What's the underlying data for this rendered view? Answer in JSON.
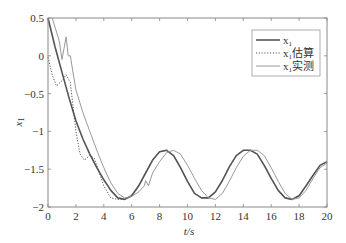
{
  "chart_data": {
    "type": "line",
    "title": "",
    "xlabel": "t/s",
    "ylabel": "x1",
    "xlim": [
      0,
      20
    ],
    "ylim": [
      -2,
      0.5
    ],
    "xticks": [
      0,
      2,
      4,
      6,
      8,
      10,
      12,
      14,
      16,
      18,
      20
    ],
    "yticks": [
      0.5,
      0,
      -0.5,
      -1,
      -1.5,
      -2
    ],
    "xtick_labels": [
      "0",
      "2",
      "4",
      "6",
      "8",
      "10",
      "12",
      "14",
      "16",
      "18",
      "20"
    ],
    "ytick_labels": [
      "0.5",
      "0",
      "−0.5",
      "−1",
      "−1.5",
      "−2"
    ],
    "grid": false,
    "legend_position": "upper right",
    "series": [
      {
        "name": "x1",
        "legend": "x₁",
        "style": "solid",
        "color": "#555555",
        "width": 1.6,
        "x": [
          0,
          0.5,
          1,
          1.5,
          2,
          2.5,
          3,
          3.5,
          4,
          4.5,
          5,
          5.5,
          6,
          6.5,
          7,
          7.5,
          8,
          8.5,
          9,
          9.5,
          10,
          10.5,
          11,
          11.5,
          12,
          12.5,
          13,
          13.5,
          14,
          14.5,
          15,
          15.5,
          16,
          16.5,
          17,
          17.5,
          18,
          18.5,
          19,
          19.5,
          20
        ],
        "y": [
          0.5,
          0.12,
          -0.22,
          -0.55,
          -0.86,
          -1.1,
          -1.3,
          -1.48,
          -1.64,
          -1.78,
          -1.88,
          -1.9,
          -1.85,
          -1.72,
          -1.55,
          -1.38,
          -1.27,
          -1.25,
          -1.32,
          -1.48,
          -1.66,
          -1.82,
          -1.88,
          -1.88,
          -1.8,
          -1.65,
          -1.47,
          -1.32,
          -1.25,
          -1.25,
          -1.3,
          -1.45,
          -1.62,
          -1.78,
          -1.88,
          -1.9,
          -1.85,
          -1.72,
          -1.58,
          -1.45,
          -1.4
        ]
      },
      {
        "name": "x1 estimate",
        "legend": "x₁估算",
        "style": "dotted",
        "color": "#555555",
        "width": 1.0,
        "x": [
          0,
          0.3,
          0.6,
          1,
          1.3,
          1.6,
          2,
          2.3,
          2.6,
          3,
          3.3,
          3.6,
          4,
          4.5,
          5,
          5.5,
          6,
          6.5,
          7,
          7.5,
          8,
          8.5,
          9,
          9.5,
          10,
          10.5,
          11,
          11.5,
          12,
          12.5,
          13,
          13.5,
          14,
          14.5,
          15,
          15.5,
          16,
          16.5,
          17,
          17.5,
          18,
          18.5,
          19,
          19.5,
          20
        ],
        "y": [
          -0.02,
          -0.25,
          -0.4,
          -0.33,
          -0.25,
          -0.35,
          -1.0,
          -1.3,
          -1.38,
          -1.32,
          -1.35,
          -1.5,
          -1.72,
          -1.88,
          -1.9,
          -1.9,
          -1.84,
          -1.72,
          -1.55,
          -1.38,
          -1.27,
          -1.25,
          -1.32,
          -1.48,
          -1.66,
          -1.82,
          -1.88,
          -1.88,
          -1.8,
          -1.65,
          -1.47,
          -1.32,
          -1.25,
          -1.25,
          -1.3,
          -1.45,
          -1.62,
          -1.78,
          -1.88,
          -1.9,
          -1.85,
          -1.72,
          -1.58,
          -1.45,
          -1.4
        ]
      },
      {
        "name": "x1 measured",
        "legend": "x₁实测",
        "style": "solid",
        "color": "#999999",
        "width": 1.0,
        "x": [
          0.3,
          0.8,
          1.0,
          1.3,
          1.45,
          1.6,
          2,
          2.5,
          3,
          3.5,
          4,
          4.5,
          5,
          5.5,
          6,
          6.5,
          6.9,
          7.0,
          7.2,
          7.5,
          8,
          8.5,
          9,
          9.5,
          10,
          10.5,
          11,
          11.5,
          12,
          12.5,
          13,
          13.5,
          14,
          14.5,
          15,
          15.5,
          16,
          16.5,
          17,
          17.5,
          18,
          18.5,
          19,
          19.5,
          20
        ],
        "y": [
          0.5,
          0.2,
          -0.05,
          0.25,
          0.0,
          0.0,
          -0.45,
          -0.75,
          -1.0,
          -1.25,
          -1.48,
          -1.68,
          -1.82,
          -1.88,
          -1.86,
          -1.8,
          -1.72,
          -1.65,
          -1.72,
          -1.55,
          -1.4,
          -1.28,
          -1.25,
          -1.3,
          -1.45,
          -1.62,
          -1.78,
          -1.88,
          -1.9,
          -1.82,
          -1.66,
          -1.48,
          -1.33,
          -1.25,
          -1.25,
          -1.32,
          -1.48,
          -1.66,
          -1.82,
          -1.9,
          -1.88,
          -1.78,
          -1.62,
          -1.48,
          -1.42
        ]
      }
    ]
  }
}
